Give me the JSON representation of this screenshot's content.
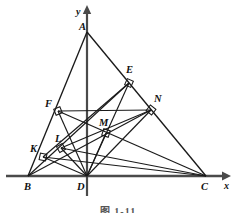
{
  "figure": {
    "type": "geometry-diagram",
    "caption": "图 1-11",
    "axes": {
      "x_label": "x",
      "y_label": "y",
      "origin_label": "D",
      "x_axis_y": 176,
      "y_axis_x": 87
    },
    "points": [
      {
        "name": "A",
        "x": 87,
        "y": 32,
        "label": "A",
        "label_x": 79,
        "label_y": 30,
        "marker": false
      },
      {
        "name": "B",
        "x": 28,
        "y": 176,
        "label": "B",
        "label_x": 24,
        "label_y": 189,
        "marker": false
      },
      {
        "name": "C",
        "x": 206,
        "y": 176,
        "label": "C",
        "label_x": 202,
        "label_y": 189,
        "marker": false
      },
      {
        "name": "D",
        "x": 87,
        "y": 176,
        "label": "D",
        "label_x": 78,
        "label_y": 189,
        "marker": false
      },
      {
        "name": "E",
        "x": 129,
        "y": 83,
        "label": "E",
        "label_x": 126,
        "label_y": 72,
        "marker": true
      },
      {
        "name": "F",
        "x": 58,
        "y": 111,
        "label": "F",
        "label_x": 46,
        "label_y": 106,
        "marker": true
      },
      {
        "name": "N",
        "x": 151,
        "y": 110,
        "label": "N",
        "label_x": 154,
        "label_y": 101,
        "marker": true
      },
      {
        "name": "M",
        "x": 106,
        "y": 133,
        "label": "M",
        "label_x": 100,
        "label_y": 125,
        "marker": true
      },
      {
        "name": "L",
        "x": 61,
        "y": 148,
        "label": "L",
        "label_x": 55,
        "label_y": 141,
        "marker": true
      },
      {
        "name": "K",
        "x": 43,
        "y": 157,
        "label": "K",
        "label_x": 31,
        "label_y": 151,
        "marker": true
      }
    ],
    "segments": [
      {
        "name": "side-AB",
        "from": "A",
        "to": "B"
      },
      {
        "name": "side-AC",
        "from": "A",
        "to": "C"
      },
      {
        "name": "altitude-AD",
        "from": "A",
        "to": "D"
      },
      {
        "name": "perp-DF",
        "from": "D",
        "to": "F"
      },
      {
        "name": "perp-DL",
        "from": "D",
        "to": "L"
      },
      {
        "name": "perp-DK",
        "from": "D",
        "to": "K"
      },
      {
        "name": "perp-DE",
        "from": "D",
        "to": "E"
      },
      {
        "name": "perp-DM",
        "from": "D",
        "to": "M"
      },
      {
        "name": "perp-DN",
        "from": "D",
        "to": "N"
      },
      {
        "name": "line-FN",
        "from": "F",
        "to": "N"
      },
      {
        "name": "line-BM-N",
        "from": "B",
        "to": "N"
      },
      {
        "name": "line-KM-E",
        "from": "K",
        "to": "E"
      },
      {
        "name": "line-LN",
        "from": "L",
        "to": "N"
      },
      {
        "name": "line-FC",
        "from": "F",
        "to": "C"
      },
      {
        "name": "line-BE",
        "from": "B",
        "to": "E"
      },
      {
        "name": "line-KC",
        "from": "K",
        "to": "C"
      },
      {
        "name": "line-LC",
        "from": "L",
        "to": "C"
      }
    ],
    "right_angle_marks": [
      "E",
      "F",
      "N",
      "M",
      "L",
      "K"
    ],
    "colors": {
      "stroke": "#1a1a1a",
      "axis": "#444444",
      "background": "#ffffff",
      "label": "#111111"
    }
  }
}
